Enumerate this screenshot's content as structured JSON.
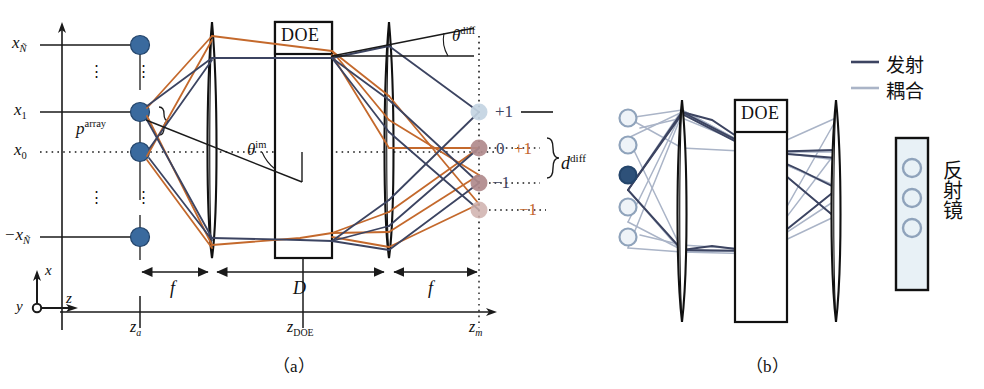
{
  "figure": {
    "title_partial_top": "",
    "panels": [
      {
        "id": "a",
        "label": "（a）",
        "caption": "Free-space DOE fan-out optical system"
      },
      {
        "id": "b",
        "label": "（b）",
        "caption": "Emission and coupling through DOE onto mirror"
      }
    ]
  },
  "panel_a": {
    "axis_labels": {
      "x_top": "x",
      "x_top_sub": "Ñ",
      "x_one": "x",
      "x_one_sub": "1",
      "x_zero": "x",
      "x_zero_sub": "0",
      "x_bottom": "−x",
      "x_bottom_sub": "Ñ",
      "vertical_dots": "⋮"
    },
    "pitch_label": {
      "sym": "p",
      "sup": "array"
    },
    "angles": [
      {
        "name": "theta-im",
        "sym": "θ",
        "sup": "im"
      },
      {
        "name": "theta-diff",
        "sym": "θ",
        "sup": "diff"
      }
    ],
    "element_labels": {
      "doe": "DOE"
    },
    "distance_labels": [
      {
        "name": "focal-left",
        "text": "f"
      },
      {
        "name": "doe-thickness",
        "text": "D"
      },
      {
        "name": "focal-right",
        "text": "f"
      }
    ],
    "z_axis_labels": [
      {
        "name": "z-array",
        "sym": "z",
        "sub": "a"
      },
      {
        "name": "z-doe",
        "sym": "z",
        "sub": "DOE"
      },
      {
        "name": "z-mirror",
        "sym": "z",
        "sub": "m"
      }
    ],
    "coord_axes": {
      "x": "x",
      "y": "y",
      "z": "z"
    },
    "spot_spacing": {
      "sym": "d",
      "sup": "diff"
    },
    "diffraction_orders": [
      {
        "row": 1,
        "blue": "+1",
        "orange": "",
        "dot_color": "#c3d4e2"
      },
      {
        "row": 2,
        "blue": "0",
        "orange": "+1",
        "dot_color": "#b08a8c"
      },
      {
        "row": 3,
        "blue": "−1",
        "orange": "0",
        "dot_color": "#b08a8c"
      },
      {
        "row": 4,
        "blue": "",
        "orange": "−1",
        "dot_color": "#cfb0ad"
      }
    ],
    "colors": {
      "ray_blue": "#3c4461",
      "ray_orange": "#c4692c",
      "source_dot": "#3a6a9e",
      "outline": "#1a1a1a"
    },
    "source_dot_count": 4
  },
  "panel_b": {
    "element_labels": {
      "doe": "DOE"
    },
    "legend": [
      {
        "name": "emission",
        "label": "发射",
        "color": "#3c4461"
      },
      {
        "name": "coupling",
        "label": "耦合",
        "color": "#a8b3c6"
      }
    ],
    "mirror_label": "反射镜",
    "source_circles": 5,
    "source_filled_index": 2,
    "mirror_circles": 3,
    "colors": {
      "emission": "#3c4461",
      "coupling": "#aab4c7",
      "circle_stroke": "#8fa3bb",
      "circle_fill": "#eef3f8",
      "filled_circle": "#2e5179",
      "mirror_fill": "#e8f1f6",
      "outline": "#1a1a1a"
    }
  }
}
